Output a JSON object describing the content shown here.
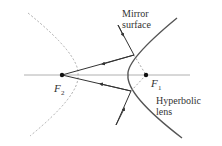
{
  "diagram": {
    "labels": {
      "mirror_line1": "Mirror",
      "mirror_line2": "surface",
      "f2": "F",
      "f2_sub": "2",
      "f1": "F",
      "f1_sub": "1",
      "lens_line1": "Hyperbolic",
      "lens_line2": "lens"
    },
    "colors": {
      "curve": "#555555",
      "axis": "#aaaaaa",
      "dashed": "#aaaaaa",
      "ray": "#333333",
      "text": "#333333"
    },
    "points": {
      "F2": [
        62,
        75
      ],
      "F1": [
        146,
        75
      ]
    }
  }
}
